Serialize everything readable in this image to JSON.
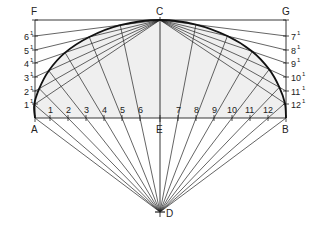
{
  "diagram": {
    "colors": {
      "line": "#222222",
      "fill": "#efefef",
      "curve": "#111111"
    },
    "points": {
      "F": {
        "label": "F",
        "x": 35,
        "y": 20
      },
      "C": {
        "label": "C",
        "x": 160,
        "y": 20
      },
      "G": {
        "label": "G",
        "x": 286,
        "y": 20
      },
      "A": {
        "label": "A",
        "x": 35,
        "y": 118
      },
      "E": {
        "label": "E",
        "x": 160,
        "y": 118
      },
      "B": {
        "label": "B",
        "x": 286,
        "y": 118
      },
      "D": {
        "label": "D",
        "x": 160,
        "y": 212
      }
    },
    "base_divisions": [
      {
        "label": "1",
        "x": 50
      },
      {
        "label": "2",
        "x": 68
      },
      {
        "label": "3",
        "x": 86
      },
      {
        "label": "4",
        "x": 104
      },
      {
        "label": "5",
        "x": 122
      },
      {
        "label": "6",
        "x": 140
      },
      {
        "label": "7",
        "x": 178
      },
      {
        "label": "8",
        "x": 196
      },
      {
        "label": "9",
        "x": 214
      },
      {
        "label": "10",
        "x": 232
      },
      {
        "label": "11",
        "x": 250
      },
      {
        "label": "12",
        "x": 268
      }
    ],
    "left_divisions": [
      {
        "label": "1",
        "sup": "1",
        "y": 104
      },
      {
        "label": "2",
        "sup": "1",
        "y": 91
      },
      {
        "label": "3",
        "sup": "1",
        "y": 77
      },
      {
        "label": "4",
        "sup": "1",
        "y": 63
      },
      {
        "label": "5",
        "sup": "1",
        "y": 50
      },
      {
        "label": "6",
        "sup": "1",
        "y": 36
      }
    ],
    "right_divisions": [
      {
        "label": "7",
        "sup": "1",
        "y": 36
      },
      {
        "label": "8",
        "sup": "1",
        "y": 50
      },
      {
        "label": "9",
        "sup": "1",
        "y": 63
      },
      {
        "label": "10",
        "sup": "1",
        "y": 77
      },
      {
        "label": "11",
        "sup": "1",
        "y": 91
      },
      {
        "label": "12",
        "sup": "1",
        "y": 104
      }
    ]
  }
}
